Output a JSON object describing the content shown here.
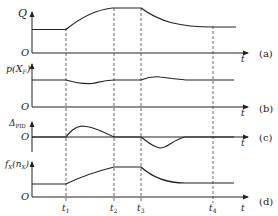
{
  "figure": {
    "panels": [
      {
        "id": "a",
        "ylabel": "Q",
        "origin": "O",
        "xlabel": "t",
        "tag": "(a)"
      },
      {
        "id": "b",
        "ylabel": "p(X_F)",
        "ylabel_main": "p(X",
        "ylabel_sub": "F",
        "ylabel_tail": ")",
        "origin": "O",
        "xlabel": "t",
        "tag": "(b)"
      },
      {
        "id": "c",
        "ylabel": "Δ_PID",
        "ylabel_main": "Δ",
        "ylabel_sub": "PID",
        "origin": "O",
        "xlabel": "t",
        "tag": "(c)"
      },
      {
        "id": "d",
        "ylabel": "f_X(n_X)",
        "ylabel_main": "f",
        "ylabel_sub": "X",
        "ylabel_mid": "(n",
        "ylabel_sub2": "X",
        "ylabel_tail": ")",
        "origin": "O",
        "xlabel": "t",
        "tag": "(d)"
      }
    ],
    "time_markers": [
      {
        "label": "t",
        "sub": "1"
      },
      {
        "label": "t",
        "sub": "2"
      },
      {
        "label": "t",
        "sub": "3"
      },
      {
        "label": "t",
        "sub": "4"
      }
    ],
    "colors": {
      "line": "#222222",
      "dash": "#444444"
    }
  }
}
